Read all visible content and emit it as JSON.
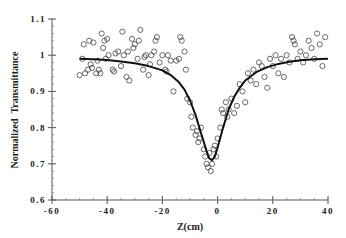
{
  "chart_data": {
    "type": "scatter",
    "title": "",
    "xlabel": "Z(cm)",
    "ylabel": "Normalized  Transmittance",
    "xlim": [
      -60,
      40
    ],
    "ylim": [
      0.6,
      1.1
    ],
    "xticks": [
      "-60",
      "-40",
      "-20",
      "0",
      "20",
      "40"
    ],
    "yticks": [
      "0.6",
      "0.7",
      "0.8",
      "0.9",
      "1",
      "1.1"
    ],
    "grid": false,
    "legend": null,
    "series": [
      {
        "name": "Experimental data",
        "style": "open-circle",
        "points": [
          [
            -50,
            0.945
          ],
          [
            -49,
            0.99
          ],
          [
            -48.5,
            1.03
          ],
          [
            -48,
            0.95
          ],
          [
            -47,
            0.96
          ],
          [
            -46.5,
            1.04
          ],
          [
            -46,
            0.975
          ],
          [
            -45.5,
            0.965
          ],
          [
            -45,
            1.035
          ],
          [
            -44,
            0.95
          ],
          [
            -43.5,
            0.985
          ],
          [
            -43,
            0.96
          ],
          [
            -42.5,
            0.95
          ],
          [
            -42,
            1.06
          ],
          [
            -41.5,
            1.02
          ],
          [
            -41,
            1.04
          ],
          [
            -40.5,
            0.99
          ],
          [
            -40,
            1.045
          ],
          [
            -39.5,
            1.0
          ],
          [
            -38,
            0.96
          ],
          [
            -37.5,
            0.955
          ],
          [
            -37,
            1.005
          ],
          [
            -36,
            1.01
          ],
          [
            -35,
            0.97
          ],
          [
            -34.5,
            1.065
          ],
          [
            -34,
            1.0
          ],
          [
            -33,
            0.94
          ],
          [
            -32.5,
            1.01
          ],
          [
            -32,
            0.93
          ],
          [
            -31,
            1.045
          ],
          [
            -30.5,
            1.02
          ],
          [
            -30,
            1.03
          ],
          [
            -29,
            0.99
          ],
          [
            -28.5,
            1.04
          ],
          [
            -28,
            1.07
          ],
          [
            -27,
            0.96
          ],
          [
            -26.5,
            0.995
          ],
          [
            -26,
            1.0
          ],
          [
            -25,
            0.945
          ],
          [
            -24.5,
            0.975
          ],
          [
            -24,
            1.0
          ],
          [
            -23,
            1.01
          ],
          [
            -22.5,
            1.04
          ],
          [
            -22,
            1.05
          ],
          [
            -21,
            0.98
          ],
          [
            -20,
            1.0
          ],
          [
            -19,
            0.96
          ],
          [
            -18.5,
            0.955
          ],
          [
            -18,
            1.0
          ],
          [
            -17,
            0.985
          ],
          [
            -16,
            0.9
          ],
          [
            -15,
            0.985
          ],
          [
            -14,
            0.99
          ],
          [
            -13.5,
            1.05
          ],
          [
            -13,
            1.04
          ],
          [
            -12,
            1.01
          ],
          [
            -11.5,
            0.96
          ],
          [
            -11,
            0.88
          ],
          [
            -10,
            0.87
          ],
          [
            -9.5,
            0.83
          ],
          [
            -9,
            0.8
          ],
          [
            -8,
            0.78
          ],
          [
            -7.5,
            0.79
          ],
          [
            -7,
            0.76
          ],
          [
            -6.5,
            0.77
          ],
          [
            -6,
            0.8
          ],
          [
            -5,
            0.74
          ],
          [
            -4.5,
            0.72
          ],
          [
            -4,
            0.7
          ],
          [
            -3.5,
            0.69
          ],
          [
            -3,
            0.73
          ],
          [
            -2.5,
            0.68
          ],
          [
            -2,
            0.7
          ],
          [
            -1.5,
            0.74
          ],
          [
            -1,
            0.75
          ],
          [
            -0.5,
            0.72
          ],
          [
            0,
            0.77
          ],
          [
            1,
            0.8
          ],
          [
            1.5,
            0.85
          ],
          [
            2,
            0.84
          ],
          [
            3,
            0.87
          ],
          [
            3.5,
            0.83
          ],
          [
            4,
            0.85
          ],
          [
            5,
            0.88
          ],
          [
            6,
            0.84
          ],
          [
            7,
            0.86
          ],
          [
            8,
            0.92
          ],
          [
            9,
            0.9
          ],
          [
            10,
            0.87
          ],
          [
            11,
            0.95
          ],
          [
            12,
            0.93
          ],
          [
            13,
            0.96
          ],
          [
            14,
            0.92
          ],
          [
            15,
            0.98
          ],
          [
            16,
            0.97
          ],
          [
            17,
            0.94
          ],
          [
            18,
            0.91
          ],
          [
            19,
            0.99
          ],
          [
            20,
            0.97
          ],
          [
            21,
            1.0
          ],
          [
            22,
            0.95
          ],
          [
            23,
            0.99
          ],
          [
            24,
            0.94
          ],
          [
            25,
            1.0
          ],
          [
            26,
            0.98
          ],
          [
            27,
            1.05
          ],
          [
            27.5,
            1.04
          ],
          [
            28,
            1.03
          ],
          [
            29,
            0.99
          ],
          [
            30,
            1.01
          ],
          [
            31,
            0.98
          ],
          [
            32,
            1.0
          ],
          [
            33,
            1.04
          ],
          [
            34,
            1.02
          ],
          [
            35,
            0.99
          ],
          [
            36,
            1.06
          ],
          [
            37,
            1.03
          ],
          [
            38,
            0.97
          ],
          [
            39,
            1.05
          ]
        ]
      },
      {
        "name": "Theoretical fit",
        "style": "solid-line",
        "points": [
          [
            -50,
            0.99
          ],
          [
            -45,
            0.989
          ],
          [
            -40,
            0.987
          ],
          [
            -35,
            0.983
          ],
          [
            -30,
            0.978
          ],
          [
            -25,
            0.97
          ],
          [
            -20,
            0.958
          ],
          [
            -17,
            0.945
          ],
          [
            -14,
            0.925
          ],
          [
            -12,
            0.905
          ],
          [
            -10,
            0.875
          ],
          [
            -8,
            0.835
          ],
          [
            -6,
            0.785
          ],
          [
            -4,
            0.735
          ],
          [
            -3,
            0.715
          ],
          [
            -2,
            0.71
          ],
          [
            -1,
            0.72
          ],
          [
            0,
            0.745
          ],
          [
            2,
            0.8
          ],
          [
            4,
            0.85
          ],
          [
            6,
            0.885
          ],
          [
            8,
            0.91
          ],
          [
            10,
            0.93
          ],
          [
            14,
            0.953
          ],
          [
            18,
            0.967
          ],
          [
            22,
            0.976
          ],
          [
            26,
            0.982
          ],
          [
            30,
            0.986
          ],
          [
            35,
            0.989
          ],
          [
            40,
            0.99
          ]
        ]
      }
    ]
  }
}
